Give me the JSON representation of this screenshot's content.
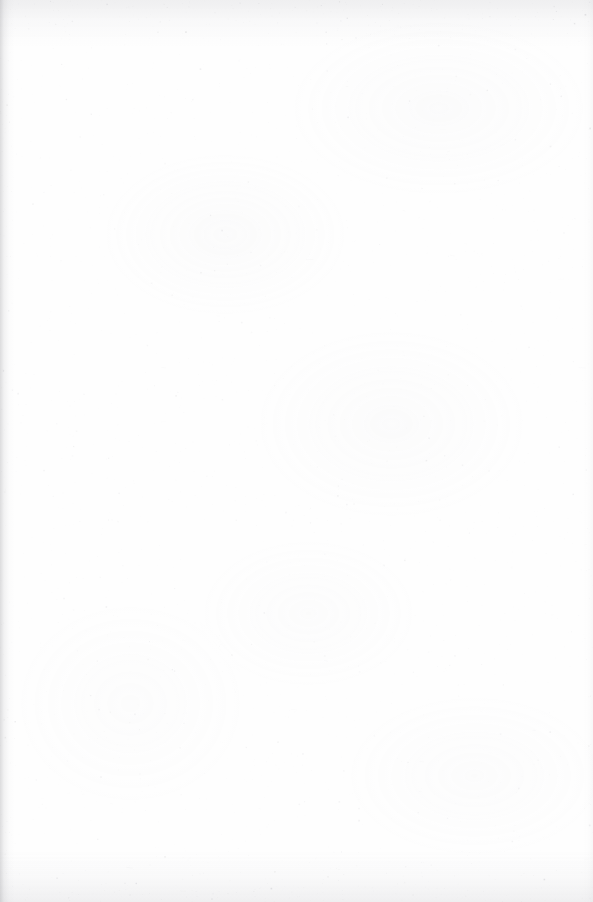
{
  "document": {
    "kind": "scanned-page",
    "page_label": "",
    "body_text": "",
    "header_text": "",
    "footer_text": "",
    "page_number": "",
    "is_blank": true
  },
  "canvas": {
    "width": 593,
    "height": 902,
    "background_color": "#ffffff",
    "paper_tint": "#fefefe"
  },
  "scan_artifacts": {
    "speckle_color": "#b4b4ba",
    "gutter_edge": "left",
    "gutter_color": "#8c8c91",
    "top_edge_band_color": "#b2b2b8",
    "bottom_edge_band_color": "#b2b2b8",
    "mottle_color": "#c6c6cc",
    "speckle_density": 0.012,
    "edge_speckle_multiplier": 3.2
  }
}
